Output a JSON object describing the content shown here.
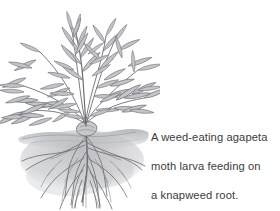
{
  "image": {
    "kind": "pencil-botanical-illustration",
    "background_color": "#ffffff",
    "subject": "knapweed plant with exposed root system below soil line",
    "width": 280,
    "height": 211
  },
  "caption": {
    "full_text": "A weed-eating agapeta moth larva feeding on a knapweed root.",
    "lines": [
      "A weed-eating agapeta",
      "moth larva feeding on",
      "a knapweed root."
    ],
    "text_color": "#3b3b40"
  },
  "illustration": {
    "label": "knapweed-plant-drawing",
    "parts": [
      {
        "name": "foliage",
        "label": "leafy stems and narrow lance-shaped leaves"
      },
      {
        "name": "soil-line",
        "label": "horizontal shaded ground surface"
      },
      {
        "name": "root-system",
        "label": "branching taproot and fibrous roots"
      }
    ],
    "ink_color": "#6d6e73",
    "shade_color": "#b9babe",
    "soil_color": "#c5c6ca"
  }
}
